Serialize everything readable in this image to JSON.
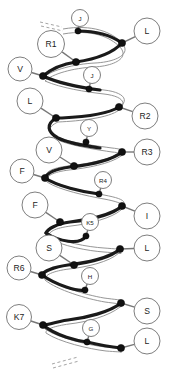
{
  "figure": {
    "type": "molecular-ribbon-diagram",
    "width": 172,
    "height": 383,
    "background_color": "#ffffff",
    "spine_color": "#1a1a1a",
    "edge_color": "#8a8a8a",
    "atom_color": "#111111",
    "label_stroke_color": "#6f6f6f"
  },
  "residues": [
    {
      "id": "res-j1",
      "label": "J",
      "side": "top",
      "size": "small",
      "cx": 80,
      "cy": 18,
      "r": 8.5,
      "atom_x": 78,
      "atom_y": 31
    },
    {
      "id": "res-l1",
      "label": "L",
      "side": "right",
      "size": "big",
      "cx": 147,
      "cy": 31,
      "r": 13.0,
      "atom_x": 122,
      "atom_y": 43
    },
    {
      "id": "res-r1",
      "label": "R1",
      "side": "left",
      "size": "big",
      "cx": 51,
      "cy": 44,
      "r": 13.5,
      "atom_x": 76,
      "atom_y": 62
    },
    {
      "id": "res-v1",
      "label": "V",
      "side": "left",
      "size": "big",
      "cx": 20,
      "cy": 69,
      "r": 12.0,
      "atom_x": 43,
      "atom_y": 76
    },
    {
      "id": "res-j2",
      "label": "J",
      "side": "mid",
      "size": "small",
      "cx": 92,
      "cy": 75,
      "r": 8.5,
      "atom_x": 89,
      "atom_y": 89
    },
    {
      "id": "res-l2",
      "label": "L",
      "side": "left",
      "size": "big",
      "cx": 30,
      "cy": 101,
      "r": 13.0,
      "atom_x": 56,
      "atom_y": 118
    },
    {
      "id": "res-r2",
      "label": "R2",
      "side": "right",
      "size": "big",
      "cx": 145,
      "cy": 116,
      "r": 13.0,
      "atom_x": 119,
      "atom_y": 107
    },
    {
      "id": "res-y1",
      "label": "Y",
      "side": "mid",
      "size": "small",
      "cx": 89,
      "cy": 128,
      "r": 8.5,
      "atom_x": 86,
      "atom_y": 142
    },
    {
      "id": "res-v2",
      "label": "V",
      "side": "left",
      "size": "big",
      "cx": 49,
      "cy": 150,
      "r": 13.0,
      "atom_x": 74,
      "atom_y": 166
    },
    {
      "id": "res-r3",
      "label": "R3",
      "side": "right",
      "size": "big",
      "cx": 147,
      "cy": 152,
      "r": 13.0,
      "atom_x": 122,
      "atom_y": 152
    },
    {
      "id": "res-f1",
      "label": "F",
      "side": "left",
      "size": "big",
      "cx": 22,
      "cy": 171,
      "r": 12.0,
      "atom_x": 45,
      "atom_y": 178
    },
    {
      "id": "res-r4",
      "label": "R4",
      "side": "mid",
      "size": "small",
      "cx": 103,
      "cy": 180,
      "r": 8.5,
      "atom_x": 99,
      "atom_y": 194
    },
    {
      "id": "res-f2",
      "label": "F",
      "side": "left",
      "size": "big",
      "cx": 35,
      "cy": 205,
      "r": 13.0,
      "atom_x": 60,
      "atom_y": 222
    },
    {
      "id": "res-i1",
      "label": "I",
      "side": "right",
      "size": "big",
      "cx": 147,
      "cy": 216,
      "r": 13.0,
      "atom_x": 122,
      "atom_y": 206
    },
    {
      "id": "res-k5",
      "label": "K5",
      "side": "mid",
      "size": "small",
      "cx": 90,
      "cy": 222,
      "r": 8.5,
      "atom_x": 86,
      "atom_y": 236
    },
    {
      "id": "res-s1",
      "label": "S",
      "side": "left",
      "size": "big",
      "cx": 49,
      "cy": 248,
      "r": 13.0,
      "atom_x": 74,
      "atom_y": 265
    },
    {
      "id": "res-l3",
      "label": "L",
      "side": "right",
      "size": "big",
      "cx": 147,
      "cy": 248,
      "r": 13.0,
      "atom_x": 120,
      "atom_y": 249
    },
    {
      "id": "res-r6",
      "label": "R6",
      "side": "left",
      "size": "big",
      "cx": 19,
      "cy": 268,
      "r": 12.0,
      "atom_x": 42,
      "atom_y": 275
    },
    {
      "id": "res-h1",
      "label": "H",
      "side": "mid",
      "size": "small",
      "cx": 90,
      "cy": 276,
      "r": 8.5,
      "atom_x": 85,
      "atom_y": 290
    },
    {
      "id": "res-s2",
      "label": "S",
      "side": "right",
      "size": "big",
      "cx": 147,
      "cy": 311,
      "r": 13.0,
      "atom_x": 121,
      "atom_y": 303
    },
    {
      "id": "res-k7",
      "label": "K7",
      "side": "left",
      "size": "big",
      "cx": 19,
      "cy": 317,
      "r": 12.5,
      "atom_x": 43,
      "atom_y": 325
    },
    {
      "id": "res-g1",
      "label": "G",
      "side": "mid",
      "size": "small",
      "cx": 91,
      "cy": 328,
      "r": 8.5,
      "atom_x": 87,
      "atom_y": 342
    },
    {
      "id": "res-l4",
      "label": "L",
      "side": "right",
      "size": "big",
      "cx": 147,
      "cy": 341,
      "r": 13.0,
      "atom_x": 121,
      "atom_y": 348
    }
  ],
  "tails": [
    {
      "id": "tail-top",
      "label": "N-terminus continuation"
    },
    {
      "id": "tail-bottom",
      "label": "C-terminus continuation"
    }
  ]
}
